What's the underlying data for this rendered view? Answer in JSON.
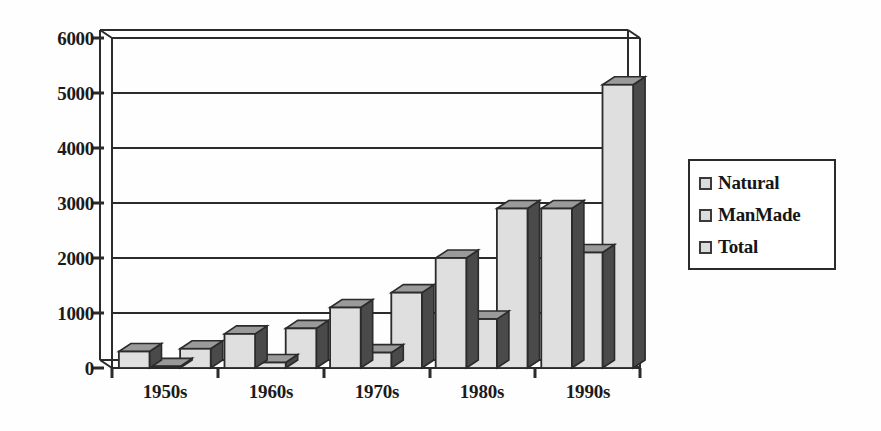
{
  "chart_data": {
    "type": "bar",
    "title": "",
    "subtitle": "",
    "xlabel": "",
    "ylabel": "",
    "categories": [
      "1950s",
      "1960s",
      "1970s",
      "1980s",
      "1990s"
    ],
    "series": [
      {
        "name": "Natural",
        "values": [
          300,
          620,
          1100,
          2000,
          2900
        ]
      },
      {
        "name": "ManMade",
        "values": [
          30,
          100,
          280,
          890,
          2100
        ]
      },
      {
        "name": "Total",
        "values": [
          350,
          720,
          1370,
          2900,
          5150
        ]
      }
    ],
    "ylim": [
      0,
      6000
    ],
    "yticks": [
      0,
      1000,
      2000,
      3000,
      4000,
      5000,
      6000
    ],
    "ytick_labels": [
      "0",
      "1000",
      "2000",
      "3000",
      "4000",
      "5000",
      "6000"
    ],
    "grid": true,
    "grid_axis": "y",
    "legend_position": "right",
    "style": "3d-bar",
    "colors": {
      "bar_face": "#dfdfdf",
      "bar_side": "#4a4a4a",
      "bar_top": "#9a9a9a",
      "bar_outline": "#2b2b2b",
      "axis": "#2b2b2b",
      "grid": "#2b2b2b",
      "text": "#1b1b1b",
      "background": "#ffffff"
    }
  },
  "legend": {
    "items": [
      {
        "label": "Natural"
      },
      {
        "label": "ManMade"
      },
      {
        "label": "Total"
      }
    ]
  },
  "axes": {
    "y_labels": [
      "6000",
      "5000",
      "4000",
      "3000",
      "2000",
      "1000",
      "0"
    ],
    "x_labels": [
      "1950s",
      "1960s",
      "1970s",
      "1980s",
      "1990s"
    ]
  }
}
